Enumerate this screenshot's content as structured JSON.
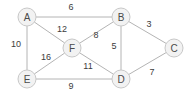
{
  "graph": {
    "title": "Weighted undirected graph",
    "style": {
      "background": "#ffffff",
      "node_fill": "#f2f2f2",
      "node_stroke": "#c8c8c8",
      "edge_stroke": "#b4b4b4",
      "label_color": "#4a4a4a",
      "weight_color": "#3c3c3c",
      "node_radius": 9
    },
    "nodes": [
      {
        "id": "A",
        "label": "A",
        "x": 27,
        "y": 17
      },
      {
        "id": "B",
        "label": "B",
        "x": 121,
        "y": 17
      },
      {
        "id": "C",
        "label": "C",
        "x": 174,
        "y": 48
      },
      {
        "id": "D",
        "label": "D",
        "x": 121,
        "y": 79
      },
      {
        "id": "E",
        "label": "E",
        "x": 27,
        "y": 79
      },
      {
        "id": "F",
        "label": "F",
        "x": 72,
        "y": 48
      }
    ],
    "edges": [
      {
        "from": "A",
        "to": "B",
        "weight": "6",
        "label_x": 71,
        "label_y": 7
      },
      {
        "from": "A",
        "to": "F",
        "weight": "12",
        "label_x": 62,
        "label_y": 29
      },
      {
        "from": "A",
        "to": "E",
        "weight": "10",
        "label_x": 16,
        "label_y": 44
      },
      {
        "from": "B",
        "to": "C",
        "weight": "3",
        "label_x": 149,
        "label_y": 24
      },
      {
        "from": "B",
        "to": "F",
        "weight": "8",
        "label_x": 96,
        "label_y": 35
      },
      {
        "from": "B",
        "to": "D",
        "weight": "5",
        "label_x": 114,
        "label_y": 46
      },
      {
        "from": "C",
        "to": "D",
        "weight": "7",
        "label_x": 152,
        "label_y": 72
      },
      {
        "from": "D",
        "to": "F",
        "weight": "11",
        "label_x": 88,
        "label_y": 66
      },
      {
        "from": "D",
        "to": "E",
        "weight": "9",
        "label_x": 71,
        "label_y": 86
      },
      {
        "from": "E",
        "to": "F",
        "weight": "16",
        "label_x": 46,
        "label_y": 57
      }
    ]
  }
}
